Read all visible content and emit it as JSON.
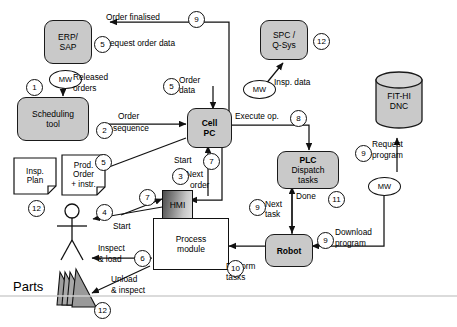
{
  "diagram": {
    "type": "flow-diagram",
    "colors": {
      "node_fill": "#c9c9c9",
      "stroke": "#1a1a1a",
      "plain_fill": "#ffffff",
      "parts_fill": "#9a9a9a",
      "background": "#ffffff"
    }
  },
  "nodes": {
    "erp_sap": {
      "line1": "ERP/",
      "line2": "SAP"
    },
    "scheduling_tool": {
      "line1": "Scheduling",
      "line2": "tool"
    },
    "cell_pc": {
      "line1": "Cell",
      "line2": "PC"
    },
    "spc_qsys": {
      "line1": "SPC /",
      "line2": "Q-Sys"
    },
    "plc": {
      "line1": "PLC",
      "line2": "Dispatch",
      "line3": "tasks"
    },
    "robot": {
      "line1": "Robot"
    },
    "fit_hi_dnc": {
      "line1": "FIT-HI",
      "line2": "DNC"
    },
    "hmi": {
      "line1": "HMI"
    },
    "process_module": {
      "line1": "Process",
      "line2": "module"
    },
    "insp_plan": {
      "line1": "Insp.",
      "line2": "Plan"
    },
    "prod_order": {
      "line1": "Prod.",
      "line2": "Order",
      "line3": "+ instr."
    },
    "parts": {
      "label": "Parts"
    }
  },
  "middleware": {
    "mw_erp": {
      "label": "MW"
    },
    "mw_cell": {
      "label": "MW"
    },
    "mw_robot": {
      "label": "MW"
    }
  },
  "edge_labels": {
    "order_finalised": "Order finalised",
    "request_order": "Request order data",
    "released_orders_1": "Released",
    "released_orders_2": "orders",
    "order_seq_1": "Order",
    "order_seq_2": "sequence",
    "order_data_1": "Order",
    "order_data_2": "data",
    "insp_data": "Insp. data",
    "execute_op": "Execute op.",
    "done": "Done",
    "next_task_1": "Next",
    "next_task_2": "task",
    "download_1": "Download",
    "download_2": "program",
    "request_prog_1": "Request",
    "request_prog_2": "program",
    "perform_1": "Perform",
    "perform_2": "tasks",
    "next_order_1": "Next",
    "next_order_2": "order",
    "start_cell": "Start",
    "start_op": "Start",
    "inspect_load_1": "Inspect",
    "inspect_load_2": "& load",
    "unload_1": "Unload",
    "unload_2": "& inspect"
  },
  "steps": {
    "s1": "1",
    "s2": "2",
    "s3": "3",
    "s4": "4",
    "s5_req": "5",
    "s5_data": "5",
    "s5_prod": "5",
    "s6": "6",
    "s7_cell": "7",
    "s7_hmi": "7",
    "s8": "8",
    "s9_final": "9",
    "s9_next_task": "9",
    "s9_download": "9",
    "s9_request": "9",
    "s10": "10",
    "s11": "11",
    "s12_qsys": "12",
    "s12_insp": "12",
    "s12_parts": "12"
  }
}
